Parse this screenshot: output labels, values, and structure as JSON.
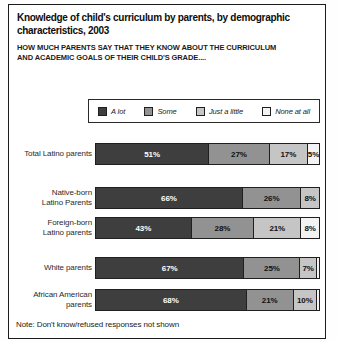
{
  "header": {
    "title": "Knowledge of child's curriculum by parents, by demographic characteristics, 2003",
    "subtitle": "HOW MUCH PARENTS SAY THAT THEY KNOW ABOUT THE CURRICULUM AND ACADEMIC GOALS OF THEIR CHILD'S GRADE...."
  },
  "note": "Note: Don't know/refused responses not shown",
  "chart_data": {
    "type": "bar",
    "variant": "horizontal-stacked-percent",
    "title": "Knowledge of child's curriculum by parents, by demographic characteristics, 2003",
    "subtitle": "HOW MUCH PARENTS SAY THAT THEY KNOW ABOUT THE CURRICULUM AND ACADEMIC GOALS OF THEIR CHILD'S GRADE....",
    "note": "Note: Don't know/refused responses not shown",
    "xlim": [
      0,
      100
    ],
    "legend_position": "top",
    "legend": [
      "A lot",
      "Some",
      "Just a little",
      "None at all"
    ],
    "colors": [
      "#3e3e3e",
      "#929292",
      "#c5c5c5",
      "#f3f3f3"
    ],
    "label_text_colors": [
      "#ffffff",
      "#101010",
      "#101010",
      "#101010"
    ],
    "categories": [
      "Total Latino parents",
      "Native-born Latino Parents",
      "Foreign-born Latino parents",
      "White parents",
      "African American parents"
    ],
    "category_lines": [
      [
        "Total Latino parents"
      ],
      [
        "Native-born",
        "Latino Parents"
      ],
      [
        "Foreign-born",
        "Latino parents"
      ],
      [
        "White parents"
      ],
      [
        "African American",
        "parents"
      ]
    ],
    "series": [
      {
        "name": "A lot",
        "values": [
          51,
          66,
          43,
          67,
          68
        ]
      },
      {
        "name": "Some",
        "values": [
          27,
          26,
          28,
          25,
          21
        ]
      },
      {
        "name": "Just a little",
        "values": [
          17,
          8,
          21,
          7,
          10
        ]
      },
      {
        "name": "None at all",
        "values": [
          5,
          0,
          8,
          1,
          1
        ]
      }
    ],
    "data_labels": [
      [
        "51%",
        "27%",
        "17%",
        "5%"
      ],
      [
        "66%",
        "26%",
        "8%",
        ""
      ],
      [
        "43%",
        "28%",
        "21%",
        "8%"
      ],
      [
        "67%",
        "25%",
        "7%",
        ""
      ],
      [
        "68%",
        "21%",
        "10%",
        ""
      ]
    ]
  }
}
